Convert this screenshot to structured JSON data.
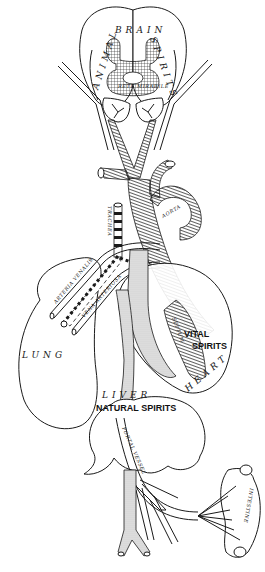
{
  "diagram": {
    "labels": {
      "brain": "BRAIN",
      "animal": "ANIMAL",
      "spirits_brain": "SPIRITS",
      "rete_mirabile": "RETE MIRABILE",
      "aorta": "AORTA",
      "trachea": "TRACHEA",
      "arteria_venalis": "ARTERIA VENALIS",
      "vena_arteriosa": "VENA ARTERIOSA",
      "lung": "LUNG",
      "vital": "VITAL",
      "spirits_vital": "SPIRITS",
      "septum": "SEPTUM",
      "heart": "HEART",
      "liver": "LIVER",
      "natural_spirits": "NATURAL SPIRITS",
      "portal_vessel": "PORTAL VESSEL",
      "intestine": "INTESTINE"
    },
    "colors": {
      "ink": "#1a1a1a",
      "stipple": "#d8d8d8",
      "background": "#ffffff"
    }
  }
}
